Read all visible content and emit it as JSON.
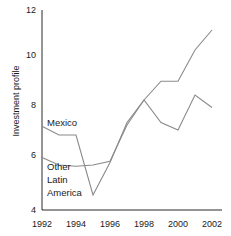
{
  "chart_data": {
    "type": "line",
    "title": "",
    "xlabel": "",
    "ylabel": "Investment profile",
    "x": [
      1992,
      1993,
      1994,
      1995,
      1996,
      1997,
      1998,
      1999,
      2000,
      2001,
      2002
    ],
    "xlim": [
      1992,
      2002
    ],
    "ylim": [
      4,
      12
    ],
    "yticks": [
      4,
      6,
      8,
      10,
      12
    ],
    "xticks": [
      1992,
      1994,
      1996,
      1998,
      2000,
      2002
    ],
    "grid": false,
    "legend_position": "inline-annotation",
    "series": [
      {
        "name": "Mexico",
        "color": "#8a8a8a",
        "values": [
          7.35,
          7.0,
          7.0,
          4.6,
          5.9,
          7.5,
          8.4,
          9.15,
          9.15,
          10.4,
          11.2
        ]
      },
      {
        "name": "Other Latin America",
        "color": "#8a8a8a",
        "values": [
          6.1,
          5.8,
          5.75,
          5.8,
          5.95,
          7.4,
          8.4,
          7.5,
          7.2,
          8.6,
          8.1
        ]
      }
    ],
    "annotations": [
      {
        "text": "Mexico",
        "x": 1993.0,
        "y": 7.6
      },
      {
        "text": "Other",
        "x": 1993.0,
        "y": 5.5
      },
      {
        "text": "Latin",
        "x": 1993.0,
        "y": 5.1
      },
      {
        "text": "America",
        "x": 1993.0,
        "y": 4.7
      }
    ]
  },
  "axis": {
    "y_tick_labels": [
      "12",
      "10",
      "8",
      "6",
      "4"
    ],
    "x_tick_labels": [
      "1992",
      "1994",
      "1996",
      "1998",
      "2000",
      "2002"
    ],
    "y_axis_title": "Investment profile"
  },
  "series_labels": {
    "mexico": "Mexico",
    "other_line1": "Other",
    "other_line2": "Latin",
    "other_line3": "America"
  }
}
